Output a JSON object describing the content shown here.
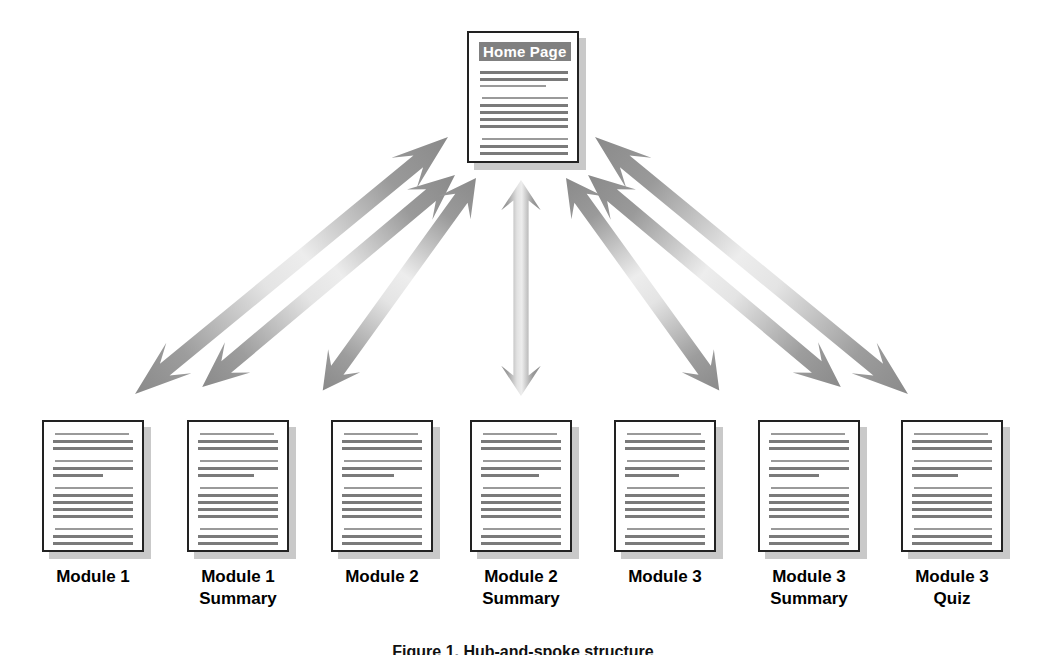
{
  "figure": {
    "type": "hub-and-spoke-site-map",
    "background_color": "#ffffff",
    "arrow_color_dark": "#8c8c8c",
    "arrow_color_light": "#e8e8e8",
    "page_border_color": "#222222",
    "page_shadow_color": "#c9c9c9",
    "text_line_color": "#7a7a7a",
    "title_band_color": "#808080",
    "title_text_color": "#ffffff",
    "caption": "Figure 1. Hub-and-spoke structure"
  },
  "hub": {
    "title": "Home Page",
    "label": "Home Page"
  },
  "nodes": [
    {
      "id": "module-1",
      "label_line1": "Module 1",
      "label_line2": ""
    },
    {
      "id": "module-1-summary",
      "label_line1": "Module 1",
      "label_line2": "Summary"
    },
    {
      "id": "module-2",
      "label_line1": "Module 2",
      "label_line2": ""
    },
    {
      "id": "module-2-summary",
      "label_line1": "Module 2",
      "label_line2": "Summary"
    },
    {
      "id": "module-3",
      "label_line1": "Module 3",
      "label_line2": ""
    },
    {
      "id": "module-3-summary",
      "label_line1": "Module 3",
      "label_line2": "Summary"
    },
    {
      "id": "module-3-quiz",
      "label_line1": "Module 3",
      "label_line2": "Quiz"
    }
  ],
  "connections": [
    {
      "from": "home-page",
      "to": "module-1",
      "style": "double-headed-arrow"
    },
    {
      "from": "home-page",
      "to": "module-1-summary",
      "style": "double-headed-arrow"
    },
    {
      "from": "home-page",
      "to": "module-2",
      "style": "double-headed-arrow"
    },
    {
      "from": "home-page",
      "to": "module-2-summary",
      "style": "double-headed-arrow"
    },
    {
      "from": "home-page",
      "to": "module-3",
      "style": "double-headed-arrow"
    },
    {
      "from": "home-page",
      "to": "module-3-summary",
      "style": "double-headed-arrow"
    },
    {
      "from": "home-page",
      "to": "module-3-quiz",
      "style": "double-headed-arrow"
    }
  ]
}
